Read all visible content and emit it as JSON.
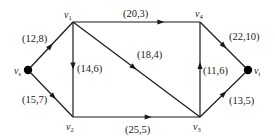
{
  "diagram": {
    "type": "directed network flow graph",
    "nodes": [
      {
        "id": "vs",
        "label": "v",
        "sub": "s",
        "x": 28,
        "y": 70,
        "filled": true,
        "lx": 14,
        "ly": 74
      },
      {
        "id": "v1",
        "label": "v",
        "sub": "1",
        "x": 73,
        "y": 22,
        "filled": false,
        "lx": 64,
        "ly": 18
      },
      {
        "id": "v2",
        "label": "v",
        "sub": "2",
        "x": 73,
        "y": 117,
        "filled": false,
        "lx": 66,
        "ly": 130
      },
      {
        "id": "v3",
        "label": "v",
        "sub": "3",
        "x": 200,
        "y": 117,
        "filled": false,
        "lx": 193,
        "ly": 130
      },
      {
        "id": "v4",
        "label": "v",
        "sub": "4",
        "x": 200,
        "y": 22,
        "filled": false,
        "lx": 195,
        "ly": 17
      },
      {
        "id": "vt",
        "label": "v",
        "sub": "t",
        "x": 248,
        "y": 70,
        "filled": true,
        "lx": 254,
        "ly": 74
      }
    ],
    "edges": [
      {
        "from": "vs",
        "to": "v1",
        "label": "(12,8)",
        "capacity": 12,
        "flow": 8,
        "lx": 22,
        "ly": 42,
        "t": 0.55
      },
      {
        "from": "vs",
        "to": "v2",
        "label": "(15,7)",
        "capacity": 15,
        "flow": 7,
        "lx": 22,
        "ly": 103,
        "t": 0.62
      },
      {
        "from": "v1",
        "to": "v4",
        "label": "(20,3)",
        "capacity": 20,
        "flow": 3,
        "lx": 123,
        "ly": 17,
        "t": 0.72
      },
      {
        "from": "v1",
        "to": "v2",
        "label": "(14,6)",
        "capacity": 14,
        "flow": 6,
        "lx": 77,
        "ly": 72,
        "t": 0.5
      },
      {
        "from": "v1",
        "to": "v3",
        "label": "(18,4)",
        "capacity": 18,
        "flow": 4,
        "lx": 137,
        "ly": 58,
        "t": 0.5
      },
      {
        "from": "v2",
        "to": "v3",
        "label": "(25,5)",
        "capacity": 25,
        "flow": 5,
        "lx": 125,
        "ly": 133,
        "t": 0.62
      },
      {
        "from": "v3",
        "to": "v4",
        "label": "(11,6)",
        "capacity": 11,
        "flow": 6,
        "lx": 203,
        "ly": 74,
        "t": 0.58
      },
      {
        "from": "v4",
        "to": "vt",
        "label": "(22,10)",
        "capacity": 22,
        "flow": 10,
        "lx": 229,
        "ly": 40,
        "t": 0.55
      },
      {
        "from": "v3",
        "to": "vt",
        "label": "(13,5)",
        "capacity": 13,
        "flow": 5,
        "lx": 229,
        "ly": 104,
        "t": 0.55
      }
    ]
  }
}
